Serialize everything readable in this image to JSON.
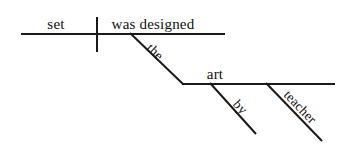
{
  "diagram": {
    "type": "reed-kellogg-sentence-diagram",
    "sentence": "The art set was designed by teacher",
    "background_color": "#ffffff",
    "line_color": "#1a1a1a",
    "text_color": "#111111",
    "labels": {
      "subject": "set",
      "verb": "was designed",
      "subject_modifier_article": "the",
      "subject_modifier_noun": "art",
      "preposition": "by",
      "prep_object": "teacher"
    },
    "parts": [
      {
        "name": "subject",
        "text": "set",
        "slot": "main-baseline-left"
      },
      {
        "name": "verb",
        "text": "was designed",
        "slot": "main-baseline-right"
      },
      {
        "name": "article-modifier",
        "text": "the",
        "slot": "diagonal-under-subject"
      },
      {
        "name": "noun-modifier",
        "text": "art",
        "slot": "secondary-baseline"
      },
      {
        "name": "preposition",
        "text": "by",
        "slot": "diagonal-under-art"
      },
      {
        "name": "object-of-preposition",
        "text": "teacher",
        "slot": "diagonal-right"
      }
    ],
    "geometry": {
      "main_baseline": {
        "x1": 21,
        "y1": 33,
        "x2": 225,
        "y2": 33
      },
      "subject_verb_divider": {
        "x": 96,
        "y1": 17,
        "y2": 52
      },
      "the_diagonal": {
        "x1": 130,
        "y1": 33,
        "x2": 182,
        "y2": 83
      },
      "secondary_baseline": {
        "x1": 182,
        "y1": 83,
        "x2": 335,
        "y2": 83
      },
      "by_diagonal": {
        "x1": 210,
        "y1": 83,
        "x2": 256,
        "y2": 134
      },
      "teacher_diagonal": {
        "x1": 266,
        "y1": 83,
        "x2": 322,
        "y2": 141
      }
    }
  }
}
